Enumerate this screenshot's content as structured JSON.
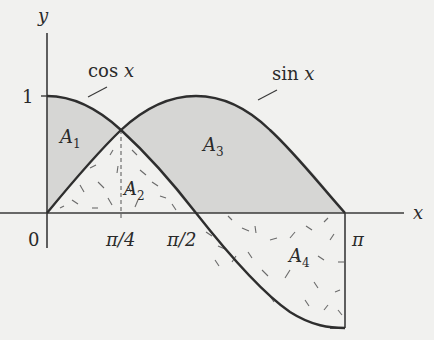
{
  "diagram": {
    "axes": {
      "x_label": "x",
      "y_label": "y",
      "origin_label": "0",
      "y_tick_label": "1",
      "x_tick_labels": [
        "π/4",
        "π/2",
        "π"
      ]
    },
    "curves": [
      {
        "name": "cos x",
        "label_fn": "cos",
        "label_var": "x"
      },
      {
        "name": "sin x",
        "label_fn": "sin",
        "label_var": "x"
      }
    ],
    "regions": [
      {
        "id": "A1",
        "base": "A",
        "sub": "1",
        "fill": "shaded",
        "description": "between cos x (top) and sin x, 0 to π/4"
      },
      {
        "id": "A2",
        "base": "A",
        "sub": "2",
        "fill": "dashed",
        "description": "below min(sin, cos), 0 to π/2"
      },
      {
        "id": "A3",
        "base": "A",
        "sub": "3",
        "fill": "shaded",
        "description": "between sin x and max(cos,0), π/4 to π"
      },
      {
        "id": "A4",
        "base": "A",
        "sub": "4",
        "fill": "dashed",
        "description": "between x-axis and cos x, π/2 to π"
      }
    ],
    "colors": {
      "background": "#f1f1ef",
      "shade": "#d6d6d4",
      "stroke": "#3a3a3a",
      "dash": "#6a6a6a"
    }
  }
}
